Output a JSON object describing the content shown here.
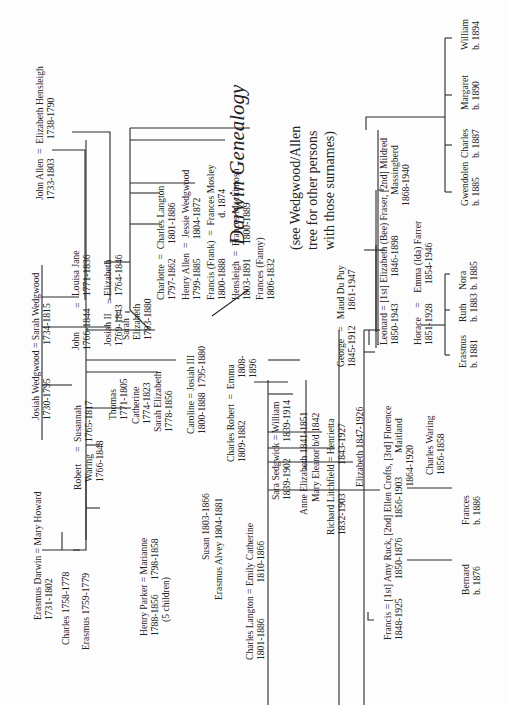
{
  "title": "Darwin Genealogy",
  "subtitle": [
    "(see Wedgwood/Allen",
    "tree for other persons",
    "with those surnames)"
  ],
  "people": {
    "allen_couple": [
      "John Allen  =  Elizabeth Hensleigh",
      "1733-1803        1738-1790"
    ],
    "wedgwood_couple": [
      "Josiah Wedgwood = Sarah Wedgwood",
      "1730-1795              1734-1815"
    ],
    "erasmus_couple": [
      "Erasmus Darwin = Mary Howard",
      "1731-1802"
    ],
    "charles_1758": [
      "Charles 1758-1778"
    ],
    "erasmus_1759": [
      "Erasmus 1759-1779"
    ],
    "robert": [
      "Robert",
      "Waring",
      "1766-1848"
    ],
    "robert_eq": [
      "="
    ],
    "susannah": [
      "Susannah",
      "1765-1817"
    ],
    "john": [
      "John",
      "1766-1844"
    ],
    "john_eq": [
      "="
    ],
    "louisa": [
      "Louisa Jane",
      "1771-1836"
    ],
    "josiah2": [
      "Josiah II",
      "1769-1843"
    ],
    "josiah2_eq": [
      "="
    ],
    "elizabeth_allen": [
      "Elizabeth",
      "1764-1846"
    ],
    "thomas": [
      "Thomas",
      "1771-1805"
    ],
    "catherine": [
      "Catherine",
      "1774-1823"
    ],
    "sarah_elizabeth_darwin": [
      "Sarah Elizabeth",
      "1778-1856"
    ],
    "sarah_elizabeth_wedgwood": [
      "Sarah",
      "Elizabeth",
      "1793-1880"
    ],
    "henry_parker": [
      "Henry Parker = Marianne",
      "1788-1856      1798-1858",
      "(5 children)"
    ],
    "caroline": [
      "Caroline = Josiah III",
      "1800-1888  1795-1880"
    ],
    "susan": [
      "Susan 1803-1866"
    ],
    "erasmus_alvey": [
      "Erasmus Alvey 1804-1881"
    ],
    "charles_robert": [
      "Charles Robert  =  Emma",
      "1809-1882"
    ],
    "emma_dates": [
      "1808-",
      "1896"
    ],
    "charlotte": [
      "Charlotte  =  Charles Langton",
      "1797-1862      1801-1886"
    ],
    "henry_allen": [
      "Henry Allen  =  Jessie Wedgwood",
      "1799-1885        1804-1872"
    ],
    "francis_frank": [
      "Francis (Frank)  =  Frances Mosley",
      "1800-1888                 d. 1874"
    ],
    "hensleigh": [
      "Hensleigh  =  Frances Mackintosh",
      "1803-1891      1800-1889"
    ],
    "fanny": [
      "Frances (Fanny)",
      "1806-1832"
    ],
    "charles_langton": [
      "Charles Langton = Emily Catherine",
      "1801-1886               1810-1866"
    ],
    "sara_sedgwick": [
      "Sara Sedgwick = William",
      "1839-1902       1839-1914"
    ],
    "anne_elizabeth": [
      "Anne Elizabeth 1841-1851"
    ],
    "mary_eleanor": [
      "Mary Eleanor b/d 1842"
    ],
    "richard_litchfield": [
      "Richard Litchfield = Henrietta",
      "1832-1903            1843-1927"
    ],
    "elizabeth_1847": [
      "Elizabeth 1847-1926"
    ],
    "george": [
      "George   =   Maud Du Puy",
      "1845-1912      1861-1947"
    ],
    "francis_1848": [
      "Francis = [1st] Amy Ruck, [2nd] Ellen Crofts, [3rd] Florence",
      "1848-1925        1850-1876        1856-1903          Maitland",
      "                                                                1864-1920"
    ],
    "leonard": [
      "Leonard = [1st] Elizabeth (Bee) Fraser, [2nd] Mildred",
      "1850-1943           1846-1898                 Massingberd",
      "                                                          1868-1940"
    ],
    "horace": [
      "Horace    =    Emma (Ida) Farrer",
      "1851-1928        1854-1946"
    ],
    "charles_waring": [
      "Charles Waring",
      "1856-1858"
    ],
    "bernard": [
      "Bernard",
      "b. 1876"
    ],
    "frances_1886": [
      "Frances",
      "b. 1886"
    ],
    "erasmus_1881": [
      "Erasmus",
      "b. 1881"
    ],
    "ruth": [
      "Ruth",
      "b. 1883"
    ],
    "nora": [
      "Nora",
      "b. 1885"
    ],
    "gwendolen": [
      "Gwendolen",
      "b. 1885"
    ],
    "charles_1887": [
      "Charles",
      "b. 1887"
    ],
    "margaret": [
      "Margaret",
      "b. 1890"
    ],
    "william_1894": [
      "William",
      "b. 1894"
    ]
  }
}
